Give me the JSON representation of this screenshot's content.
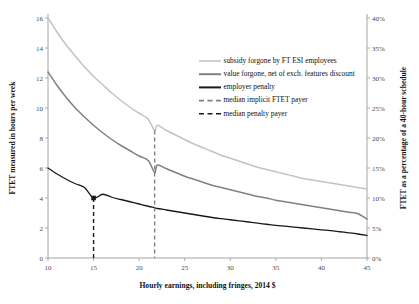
{
  "chart_data": {
    "type": "line",
    "title": "",
    "xlabel": "Hourly earnings, including fringes, 2014 $",
    "ylabel": "FTET measured in hours per week",
    "ylabel_right": "FTET as a percentage of a 40-hour schedule",
    "xlim": [
      10,
      45
    ],
    "ylim": [
      0,
      16
    ],
    "ylim_right": [
      0,
      40
    ],
    "grid": false,
    "legend_position": "upper right inside",
    "xticks": [
      10,
      15,
      20,
      25,
      30,
      35,
      40,
      45
    ],
    "xticklabels": [
      "10",
      "15",
      "20",
      "25",
      "30",
      "35",
      "40",
      "45"
    ],
    "yticks": [
      0,
      2,
      4,
      6,
      8,
      10,
      12,
      14,
      16
    ],
    "yticklabels": [
      "0",
      "2",
      "4",
      "6",
      "8",
      "10",
      "12",
      "14",
      "16"
    ],
    "yticks_right": [
      0,
      5,
      10,
      15,
      20,
      25,
      30,
      35,
      40
    ],
    "yticklabels_right": [
      "0%",
      "5%",
      "10%",
      "15%",
      "20%",
      "25%",
      "30%",
      "35%",
      "40%"
    ],
    "x": [
      10,
      11,
      12,
      13,
      14,
      15,
      16,
      17,
      18,
      19,
      20,
      21,
      21.7,
      22,
      23,
      24,
      25,
      26,
      27,
      28,
      29,
      30,
      31,
      32,
      33,
      34,
      35,
      36,
      37,
      38,
      39,
      40,
      41,
      42,
      43,
      44,
      45
    ],
    "series": [
      {
        "name": "subsidy forgone by FT ESI employees",
        "color": "#c3c3c3",
        "linewidth": 1.5,
        "dash": "solid",
        "values": [
          16.0,
          15.05,
          14.2,
          13.45,
          12.75,
          12.1,
          11.55,
          11.0,
          10.5,
          10.05,
          9.65,
          9.25,
          8.5,
          8.85,
          8.5,
          8.2,
          7.9,
          7.6,
          7.35,
          7.1,
          6.85,
          6.65,
          6.45,
          6.25,
          6.05,
          5.9,
          5.75,
          5.6,
          5.45,
          5.3,
          5.2,
          5.1,
          5.0,
          4.9,
          4.8,
          4.7,
          4.6
        ]
      },
      {
        "name": "value forgone, net of exch. features discount",
        "color": "#808080",
        "linewidth": 1.5,
        "dash": "solid",
        "values": [
          12.4,
          11.5,
          10.7,
          10.0,
          9.4,
          8.85,
          8.35,
          7.9,
          7.5,
          7.15,
          6.8,
          6.5,
          5.7,
          6.2,
          5.95,
          5.7,
          5.45,
          5.25,
          5.05,
          4.85,
          4.7,
          4.55,
          4.4,
          4.25,
          4.1,
          4.0,
          3.85,
          3.75,
          3.65,
          3.55,
          3.45,
          3.35,
          3.25,
          3.15,
          3.05,
          2.95,
          2.6
        ]
      },
      {
        "name": "employer penalty",
        "color": "#1a1a1a",
        "linewidth": 1.3,
        "dash": "solid",
        "values": [
          6.0,
          5.6,
          5.25,
          4.95,
          4.7,
          4.0,
          4.25,
          4.05,
          3.9,
          3.75,
          3.6,
          3.45,
          3.35,
          3.3,
          3.2,
          3.1,
          3.0,
          2.9,
          2.8,
          2.7,
          2.62,
          2.55,
          2.48,
          2.4,
          2.32,
          2.25,
          2.18,
          2.12,
          2.06,
          2.0,
          1.94,
          1.88,
          1.82,
          1.75,
          1.68,
          1.6,
          1.5
        ]
      }
    ],
    "vlines": [
      {
        "name": "median implicit FTET payer",
        "x": 21.7,
        "color": "#808080",
        "dash": "dashed",
        "y_top": 8.5,
        "y_bottom": 0
      },
      {
        "name": "median penalty payer",
        "x": 15,
        "color": "#1a1a1a",
        "dash": "dashed",
        "y_top": 4.0,
        "y_bottom": 0
      }
    ],
    "markers": [
      {
        "name": "median-penalty-payer-point",
        "x": 15,
        "y": 4.0,
        "color": "#1a1a1a"
      }
    ],
    "legend": [
      {
        "label": "subsidy forgone by FT ESI employees",
        "color": "#c3c3c3",
        "dash": "solid",
        "linewidth": 1.6
      },
      {
        "label": "value forgone, net of exch. features discount",
        "color": "#808080",
        "dash": "solid",
        "linewidth": 2.0
      },
      {
        "label": "employer penalty",
        "color": "#1a1a1a",
        "dash": "solid",
        "linewidth": 2.0
      },
      {
        "label": "median implicit FTET payer",
        "color": "#808080",
        "dash": "dashed",
        "linewidth": 1.6
      },
      {
        "label": "median penalty payer",
        "color": "#1a1a1a",
        "dash": "dashed",
        "linewidth": 1.6
      }
    ]
  }
}
